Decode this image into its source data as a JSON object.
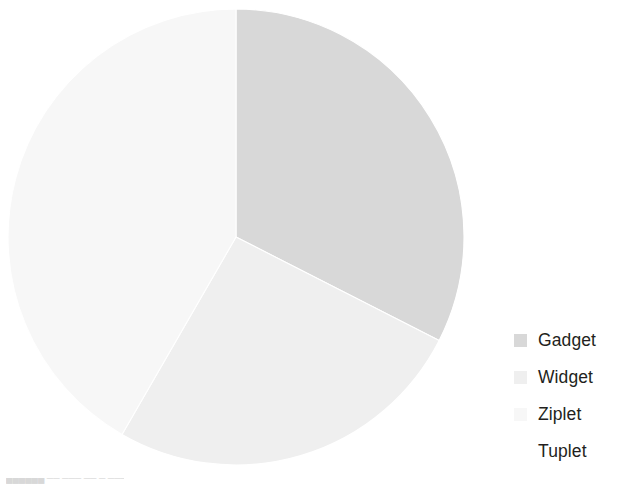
{
  "chart_data": {
    "type": "pie",
    "title": "",
    "subtitle": "",
    "xlabel": "",
    "ylabel": "",
    "grid": false,
    "legend_position": "right",
    "start_angle_deg": 0,
    "direction": "clockwise",
    "categories": [
      "Gadget",
      "Widget",
      "Ziplet",
      "Tuplet"
    ],
    "values": [
      32.5,
      25.8,
      41.7,
      0
    ],
    "units": "percent",
    "slices": [
      {
        "label": "Gadget",
        "value": 32.5,
        "start_angle_deg": 0,
        "end_angle_deg": 117,
        "sweep_deg": 117,
        "color": "#d8d8d8"
      },
      {
        "label": "Widget",
        "value": 25.8,
        "start_angle_deg": 117,
        "end_angle_deg": 210,
        "sweep_deg": 93,
        "color": "#efefef"
      },
      {
        "label": "Ziplet",
        "value": 41.7,
        "start_angle_deg": 210,
        "end_angle_deg": 360,
        "sweep_deg": 150,
        "color": "#f7f7f7"
      },
      {
        "label": "Tuplet",
        "value": 0,
        "start_angle_deg": 360,
        "end_angle_deg": 360,
        "sweep_deg": 0,
        "color": "#ffffff"
      }
    ]
  },
  "legend": {
    "items": [
      {
        "label": "Gadget",
        "color": "#d8d8d8"
      },
      {
        "label": "Widget",
        "color": "#efefef"
      },
      {
        "label": "Ziplet",
        "color": "#f7f7f7"
      },
      {
        "label": "Tuplet",
        "color": "#ffffff"
      }
    ]
  },
  "geometry": {
    "center_x": 236,
    "center_y": 237,
    "radius": 228
  },
  "colors": {
    "background": "#ffffff",
    "slice_border": "#ffffff",
    "legend_text": "#231f20"
  },
  "artifact": {
    "clipped_text": "██████ ── ─── ── ─ ────"
  }
}
